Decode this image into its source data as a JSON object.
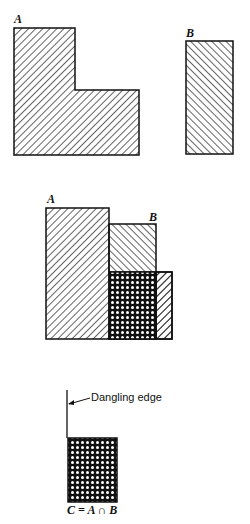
{
  "figure1": {
    "label_a": "A",
    "label_b": "B"
  },
  "figure2": {
    "label_a": "A",
    "label_b": "B"
  },
  "figure3": {
    "annotation": "Dangling edge",
    "caption": "C = A ∩ B"
  },
  "colors": {
    "stroke": "#111111",
    "background": "#ffffff"
  }
}
